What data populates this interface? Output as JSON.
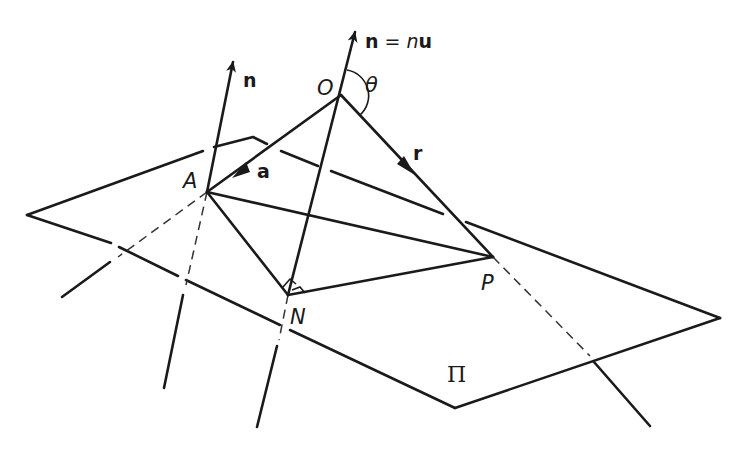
{
  "figure": {
    "labels": {
      "normal_O": "n = nu",
      "normal_O_parts": {
        "bold_n": "n",
        "eq": " = ",
        "italic_n": "n",
        "bold_u": "u"
      },
      "normal_A": "n",
      "origin": "O",
      "angle": "θ",
      "point_A": "A",
      "point_N": "N",
      "point_P": "P",
      "vector_a": "a",
      "vector_r": "r",
      "plane": "Π"
    },
    "points": {
      "O": [
        341,
        95
      ],
      "A": [
        207,
        192
      ],
      "N": [
        288,
        295
      ],
      "P": [
        493,
        257
      ]
    },
    "colors": {
      "ink": "#1a1a1a",
      "background": "#ffffff"
    }
  }
}
